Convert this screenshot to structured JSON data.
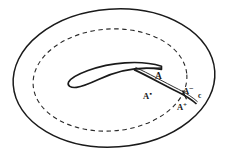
{
  "figure": {
    "background_color": "#ffffff",
    "stroke_color": "#1a1a1a",
    "width": 228,
    "height": 159,
    "shapes": {
      "outer_boundary": {
        "name": "outer-ellipse",
        "style": "solid",
        "cx": 114,
        "cy": 78,
        "rx": 102,
        "ry": 70,
        "rotation_deg": -4
      },
      "inner_boundary": {
        "name": "inner-ellipse",
        "style": "dashed",
        "cx": 110,
        "cy": 80,
        "rx": 77,
        "ry": 52,
        "rotation_deg": -4
      },
      "slit": {
        "name": "crescent-slit",
        "style": "solid-double",
        "left_tip_x": 68,
        "left_tip_y": 83,
        "right_end_x": 162,
        "right_end_y": 67
      },
      "curve_c": {
        "name": "curve-c",
        "style": "solid-double",
        "start_x": 134,
        "start_y": 70,
        "end_x": 196,
        "end_y": 104
      }
    },
    "labels": [
      {
        "id": "A",
        "text": "A",
        "sup": "",
        "x": 155,
        "y": 72
      },
      {
        "id": "A-dot",
        "text": "A",
        "sup": "▪",
        "x": 143,
        "y": 92
      },
      {
        "id": "A-minus",
        "text": "A",
        "sup": "−",
        "x": 183,
        "y": 87
      },
      {
        "id": "c",
        "text": "c",
        "sup": "",
        "x": 198,
        "y": 92
      },
      {
        "id": "A-plus",
        "text": "A",
        "sup": "+",
        "x": 177,
        "y": 103
      }
    ]
  }
}
